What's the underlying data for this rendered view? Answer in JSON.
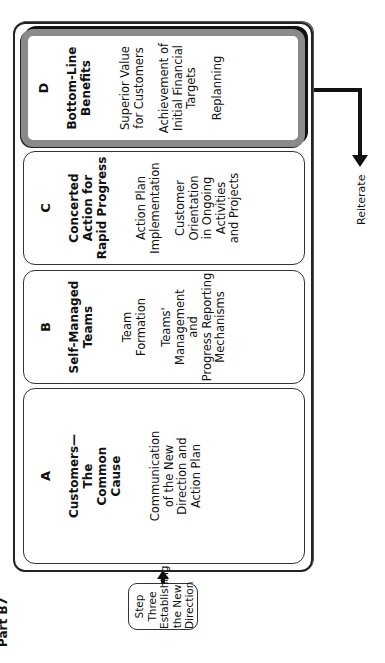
{
  "figure_label": "Part B7",
  "start_box": {
    "text": "Step Three\nEstablishing\nthe New\nDirection"
  },
  "panels": [
    {
      "letter": "A",
      "title": "Customers—\nThe\nCommon\nCause",
      "items": [
        "Communication\nof the New\nDirection and\nAction Plan"
      ]
    },
    {
      "letter": "B",
      "title": "Self-Managed\nTeams",
      "items": [
        "Team\nFormation",
        "Teams'\nManagement\nand\nProgress Reporting\nMechanisms"
      ]
    },
    {
      "letter": "C",
      "title": "Concerted\nAction for\nRapid Progress",
      "items": [
        "Action Plan\nImplementation",
        "Customer\nOrientation\nin Ongoing\nActivities\nand Projects"
      ]
    },
    {
      "letter": "D",
      "title": "Bottom-Line\nBenefits",
      "items": [
        "Superior Value\nfor Customers",
        "Achievement of\nInitial Financial\nTargets",
        "Replanning"
      ]
    }
  ],
  "exit_label": "Reiterate",
  "colors": {
    "highlight_border": "#8a8a8a",
    "line": "#111111"
  }
}
